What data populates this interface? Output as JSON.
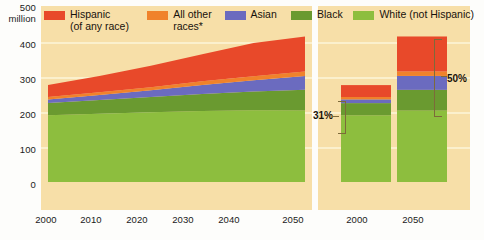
{
  "chart_data": {
    "type": "area",
    "title": "",
    "subtitle": "",
    "xlabel": "",
    "ylabel": "500 million",
    "ylim": [
      0,
      500
    ],
    "yticks": [
      0,
      100,
      200,
      300,
      400,
      500
    ],
    "ytick_labels": [
      "0",
      "100",
      "200",
      "300",
      "400",
      "500"
    ],
    "y_axis_unit": "million",
    "grid": true,
    "legend_position": "top",
    "stack_order_bottom_to_top": [
      "White (not Hispanic)",
      "Black",
      "Asian",
      "All other races*",
      "Hispanic (of any race)"
    ],
    "x": [
      2000,
      2010,
      2020,
      2030,
      2040,
      2050
    ],
    "xtick_labels": [
      "2000",
      "2010",
      "2020",
      "2030",
      "2040",
      "2050"
    ],
    "series": [
      {
        "name": "White (not Hispanic)",
        "color": "#8dbe3e",
        "values": [
          196,
          201,
          205,
          209,
          211,
          210
        ]
      },
      {
        "name": "Black",
        "color": "#6a9a30",
        "values": [
          36,
          40,
          45,
          50,
          55,
          61
        ]
      },
      {
        "name": "Asian",
        "color": "#6b6bbf",
        "values": [
          11,
          15,
          20,
          26,
          33,
          41
        ]
      },
      {
        "name": "All other races*",
        "color": "#f0822b",
        "values": [
          7,
          8,
          9,
          11,
          12,
          13
        ]
      },
      {
        "name": "Hispanic (of any race)",
        "color": "#e8492a",
        "values": [
          35,
          48,
          63,
          80,
          98,
          103
        ]
      }
    ],
    "totals": [
      275,
      312,
      342,
      376,
      409,
      428
    ],
    "secondary_bars": {
      "type": "bar",
      "categories": [
        "2000",
        "2050"
      ],
      "xtick_labels": [
        "2000",
        "2050"
      ],
      "bars": [
        {
          "year": "2000",
          "total": 275,
          "minority_share_label": "31%",
          "segments": [
            {
              "name": "White (not Hispanic)",
              "color": "#8dbe3e",
              "value": 196
            },
            {
              "name": "Black",
              "color": "#6a9a30",
              "value": 36
            },
            {
              "name": "Asian",
              "color": "#6b6bbf",
              "value": 11
            },
            {
              "name": "All other races*",
              "color": "#f0822b",
              "value": 7
            },
            {
              "name": "Hispanic (of any race)",
              "color": "#e8492a",
              "value": 35
            }
          ]
        },
        {
          "year": "2050",
          "total": 428,
          "minority_share_label": "50%",
          "segments": [
            {
              "name": "White (not Hispanic)",
              "color": "#8dbe3e",
              "value": 210
            },
            {
              "name": "Black",
              "color": "#6a9a30",
              "value": 61
            },
            {
              "name": "Asian",
              "color": "#6b6bbf",
              "value": 41
            },
            {
              "name": "All other races*",
              "color": "#f0822b",
              "value": 13
            },
            {
              "name": "Hispanic (of any race)",
              "color": "#e8492a",
              "value": 103
            }
          ]
        }
      ]
    },
    "annotations": [
      {
        "text": "31%",
        "target": "2000 bar minority portion"
      },
      {
        "text": "50%",
        "target": "2050 bar minority portion"
      }
    ]
  },
  "axis": {
    "y_top_label": "500",
    "y_unit_label": "million",
    "y_400": "400",
    "y_300": "300",
    "y_200": "200",
    "y_100": "100",
    "y_0": "0",
    "x_left": [
      "2000",
      "2010",
      "2020",
      "2030",
      "2040",
      "2050"
    ],
    "x_right": [
      "2000",
      "2050"
    ]
  },
  "legend": {
    "items": [
      {
        "label_line1": "Hispanic",
        "label_line2": "(of any race)",
        "color": "#e8492a",
        "swatch_name": "legend-swatch-hispanic"
      },
      {
        "label_line1": "All other",
        "label_line2": "races*",
        "color": "#f0822b",
        "swatch_name": "legend-swatch-all-other-races"
      },
      {
        "label_line1": "Asian",
        "label_line2": "",
        "color": "#6b6bbf",
        "swatch_name": "legend-swatch-asian"
      },
      {
        "label_line1": "Black",
        "label_line2": "",
        "color": "#6a9a30",
        "swatch_name": "legend-swatch-black"
      },
      {
        "label_line1": "White (not Hispanic)",
        "label_line2": "",
        "color": "#8dbe3e",
        "swatch_name": "legend-swatch-white-not-hispanic"
      }
    ]
  },
  "annotations": {
    "pct_2000": "31%",
    "pct_2050": "50%"
  },
  "colors": {
    "panel_background": "#f7dfa8",
    "gridline": "#fbf0cf",
    "page_background": "#fdfdfb",
    "bracket": "#7d6a3a",
    "text": "#17120d"
  }
}
